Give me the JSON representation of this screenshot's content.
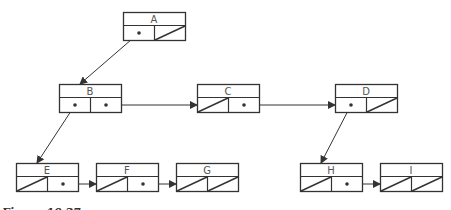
{
  "diagram": {
    "type": "binary-tree-linked-representation",
    "nodes": [
      {
        "id": "A",
        "label": "A",
        "x": 123,
        "y": 12,
        "left": "pointer",
        "right": "null"
      },
      {
        "id": "B",
        "label": "B",
        "x": 59,
        "y": 84,
        "left": "pointer",
        "right": "pointer"
      },
      {
        "id": "C",
        "label": "C",
        "x": 197,
        "y": 84,
        "left": "null",
        "right": "pointer"
      },
      {
        "id": "D",
        "label": "D",
        "x": 335,
        "y": 84,
        "left": "pointer",
        "right": "null"
      },
      {
        "id": "E",
        "label": "E",
        "x": 16,
        "y": 163,
        "left": "null",
        "right": "pointer"
      },
      {
        "id": "F",
        "label": "F",
        "x": 96,
        "y": 163,
        "left": "null",
        "right": "pointer"
      },
      {
        "id": "G",
        "label": "G",
        "x": 176,
        "y": 163,
        "left": "null",
        "right": "null"
      },
      {
        "id": "H",
        "label": "H",
        "x": 300,
        "y": 163,
        "left": "null",
        "right": "pointer"
      },
      {
        "id": "I",
        "label": "I",
        "x": 380,
        "y": 163,
        "left": "null",
        "right": "null"
      }
    ],
    "edges": [
      {
        "from": "A",
        "slot": "left",
        "to": "B"
      },
      {
        "from": "B",
        "slot": "left",
        "to": "E"
      },
      {
        "from": "B",
        "slot": "right",
        "to": "C"
      },
      {
        "from": "C",
        "slot": "right",
        "to": "D"
      },
      {
        "from": "D",
        "slot": "left",
        "to": "H"
      },
      {
        "from": "E",
        "slot": "right",
        "to": "F"
      },
      {
        "from": "F",
        "slot": "right",
        "to": "G"
      },
      {
        "from": "H",
        "slot": "right",
        "to": "I"
      }
    ]
  },
  "caption": "Figure 10.27",
  "colors": {
    "line": "#333333",
    "label": "#555555",
    "background": "#ffffff"
  }
}
